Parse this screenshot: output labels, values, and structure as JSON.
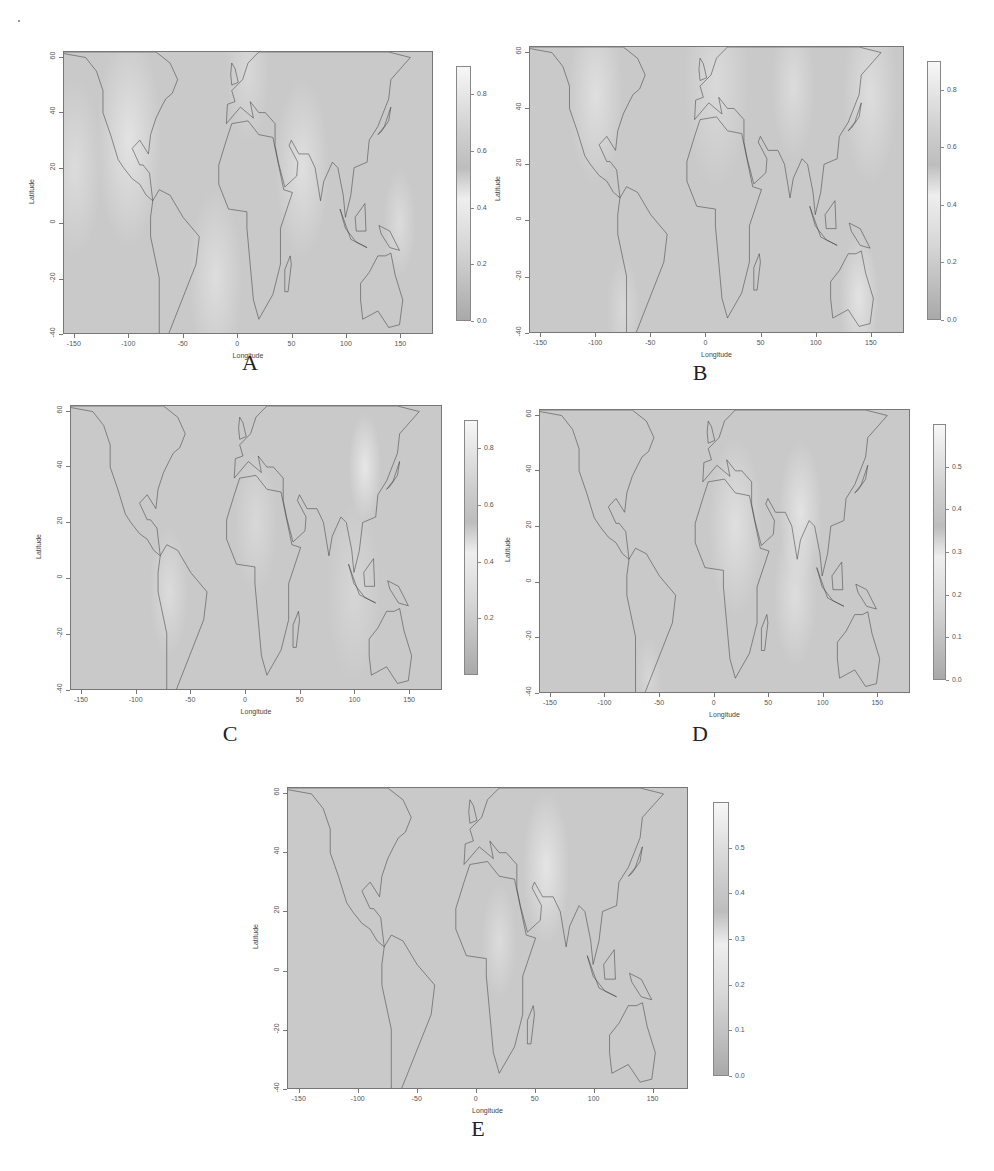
{
  "figure": {
    "panels": [
      {
        "id": "A",
        "label": "A",
        "xlabel": "Longitude",
        "ylabel": "Latitude",
        "xticks": [
          "-150",
          "-100",
          "-50",
          "0",
          "50",
          "100",
          "150"
        ],
        "yticks": [
          "-40",
          "-20",
          "0",
          "20",
          "40",
          "60"
        ],
        "colorbar": {
          "ticks": [
            "0.0",
            "0.2",
            "0.4",
            "0.6",
            "0.8"
          ],
          "range": [
            0.0,
            0.9
          ]
        },
        "box": {
          "map": [
            63,
            51,
            370,
            283
          ],
          "cbar": [
            456,
            66,
            15,
            255
          ],
          "label": [
            250,
            362
          ]
        }
      },
      {
        "id": "B",
        "label": "B",
        "xlabel": "Longitude",
        "ylabel": "Latitude",
        "xticks": [
          "-150",
          "-100",
          "-50",
          "0",
          "50",
          "100",
          "150"
        ],
        "yticks": [
          "-40",
          "-20",
          "0",
          "20",
          "40",
          "60"
        ],
        "colorbar": {
          "ticks": [
            "0.0",
            "0.2",
            "0.4",
            "0.6",
            "0.8"
          ],
          "range": [
            0.0,
            0.9
          ]
        },
        "box": {
          "map": [
            529,
            46,
            375,
            287
          ],
          "cbar": [
            927,
            61,
            14,
            259
          ],
          "label": [
            700,
            372
          ]
        }
      },
      {
        "id": "C",
        "label": "C",
        "xlabel": "Longitude",
        "ylabel": "Latitude",
        "xticks": [
          "-150",
          "-100",
          "-50",
          "0",
          "50",
          "100",
          "150"
        ],
        "yticks": [
          "-40",
          "-20",
          "0",
          "20",
          "40",
          "60"
        ],
        "colorbar": {
          "ticks": [
            "0.2",
            "0.4",
            "0.6",
            "0.8"
          ],
          "range": [
            0.0,
            0.9
          ]
        },
        "box": {
          "map": [
            70,
            405,
            372,
            285
          ],
          "cbar": [
            464,
            420,
            14,
            255
          ],
          "label": [
            230,
            733
          ]
        }
      },
      {
        "id": "D",
        "label": "D",
        "xlabel": "Longitude",
        "ylabel": "Latitude",
        "xticks": [
          "-150",
          "-100",
          "-50",
          "0",
          "50",
          "100",
          "150"
        ],
        "yticks": [
          "-40",
          "-20",
          "0",
          "20",
          "40",
          "60"
        ],
        "colorbar": {
          "ticks": [
            "0.0",
            "0.1",
            "0.2",
            "0.3",
            "0.4",
            "0.5"
          ],
          "range": [
            0.0,
            0.6
          ]
        },
        "box": {
          "map": [
            539,
            409,
            371,
            284
          ],
          "cbar": [
            933,
            424,
            13,
            256
          ],
          "label": [
            700,
            733
          ]
        }
      },
      {
        "id": "E",
        "label": "E",
        "xlabel": "Longitude",
        "ylabel": "Latitude",
        "xticks": [
          "-150",
          "-100",
          "-50",
          "0",
          "50",
          "100",
          "150"
        ],
        "yticks": [
          "-40",
          "-20",
          "0",
          "20",
          "40",
          "60"
        ],
        "colorbar": {
          "ticks": [
            "0.0",
            "0.1",
            "0.2",
            "0.3",
            "0.4",
            "0.5"
          ],
          "range": [
            0.0,
            0.6
          ]
        },
        "box": {
          "map": [
            287,
            787,
            401,
            302
          ],
          "cbar": [
            713,
            802,
            16,
            274
          ],
          "label": [
            478,
            1128
          ]
        }
      }
    ],
    "axis_ranges": {
      "lon": [
        -160,
        180
      ],
      "lat": [
        -40,
        62
      ]
    },
    "colors": {
      "map_bg": "#c9c9c9",
      "map_light": "#eeeeee",
      "coast": "#3a3a3a",
      "cbar_top": "#f7f7f7",
      "cbar_bottom": "#a9a9a9"
    }
  },
  "chart_data": [
    {
      "type": "heatmap",
      "title": "A",
      "xlabel": "Longitude",
      "ylabel": "Latitude",
      "xlim": [
        -160,
        180
      ],
      "ylim": [
        -40,
        62
      ],
      "colorbar_range": [
        0.0,
        0.9
      ],
      "colorbar_ticks": [
        0.0,
        0.2,
        0.4,
        0.6,
        0.8
      ],
      "grid": false,
      "legend_position": "right"
    },
    {
      "type": "heatmap",
      "title": "B",
      "xlabel": "Longitude",
      "ylabel": "Latitude",
      "xlim": [
        -160,
        180
      ],
      "ylim": [
        -40,
        62
      ],
      "colorbar_range": [
        0.0,
        0.9
      ],
      "colorbar_ticks": [
        0.0,
        0.2,
        0.4,
        0.6,
        0.8
      ],
      "grid": false,
      "legend_position": "right"
    },
    {
      "type": "heatmap",
      "title": "C",
      "xlabel": "Longitude",
      "ylabel": "Latitude",
      "xlim": [
        -160,
        180
      ],
      "ylim": [
        -40,
        62
      ],
      "colorbar_range": [
        0.0,
        0.9
      ],
      "colorbar_ticks": [
        0.2,
        0.4,
        0.6,
        0.8
      ],
      "grid": false,
      "legend_position": "right"
    },
    {
      "type": "heatmap",
      "title": "D",
      "xlabel": "Longitude",
      "ylabel": "Latitude",
      "xlim": [
        -160,
        180
      ],
      "ylim": [
        -40,
        62
      ],
      "colorbar_range": [
        0.0,
        0.6
      ],
      "colorbar_ticks": [
        0.0,
        0.1,
        0.2,
        0.3,
        0.4,
        0.5
      ],
      "grid": false,
      "legend_position": "right"
    },
    {
      "type": "heatmap",
      "title": "E",
      "xlabel": "Longitude",
      "ylabel": "Latitude",
      "xlim": [
        -160,
        180
      ],
      "ylim": [
        -40,
        62
      ],
      "colorbar_range": [
        0.0,
        0.6
      ],
      "colorbar_ticks": [
        0.0,
        0.1,
        0.2,
        0.3,
        0.4,
        0.5
      ],
      "grid": false,
      "legend_position": "right"
    }
  ]
}
